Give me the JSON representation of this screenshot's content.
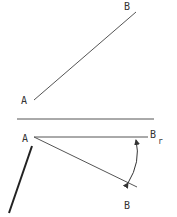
{
  "diagram": {
    "colors": {
      "line": "#555555",
      "thick_line": "#222222",
      "text": "#333333",
      "background": "#ffffff"
    },
    "top_view": {
      "label_A": "A",
      "label_B": "B"
    },
    "bottom_view": {
      "label_A": "A",
      "label_B": "B",
      "label_Br_main": "B",
      "label_Br_sub": "r",
      "rotation_arrow": "double-headed arc"
    }
  }
}
